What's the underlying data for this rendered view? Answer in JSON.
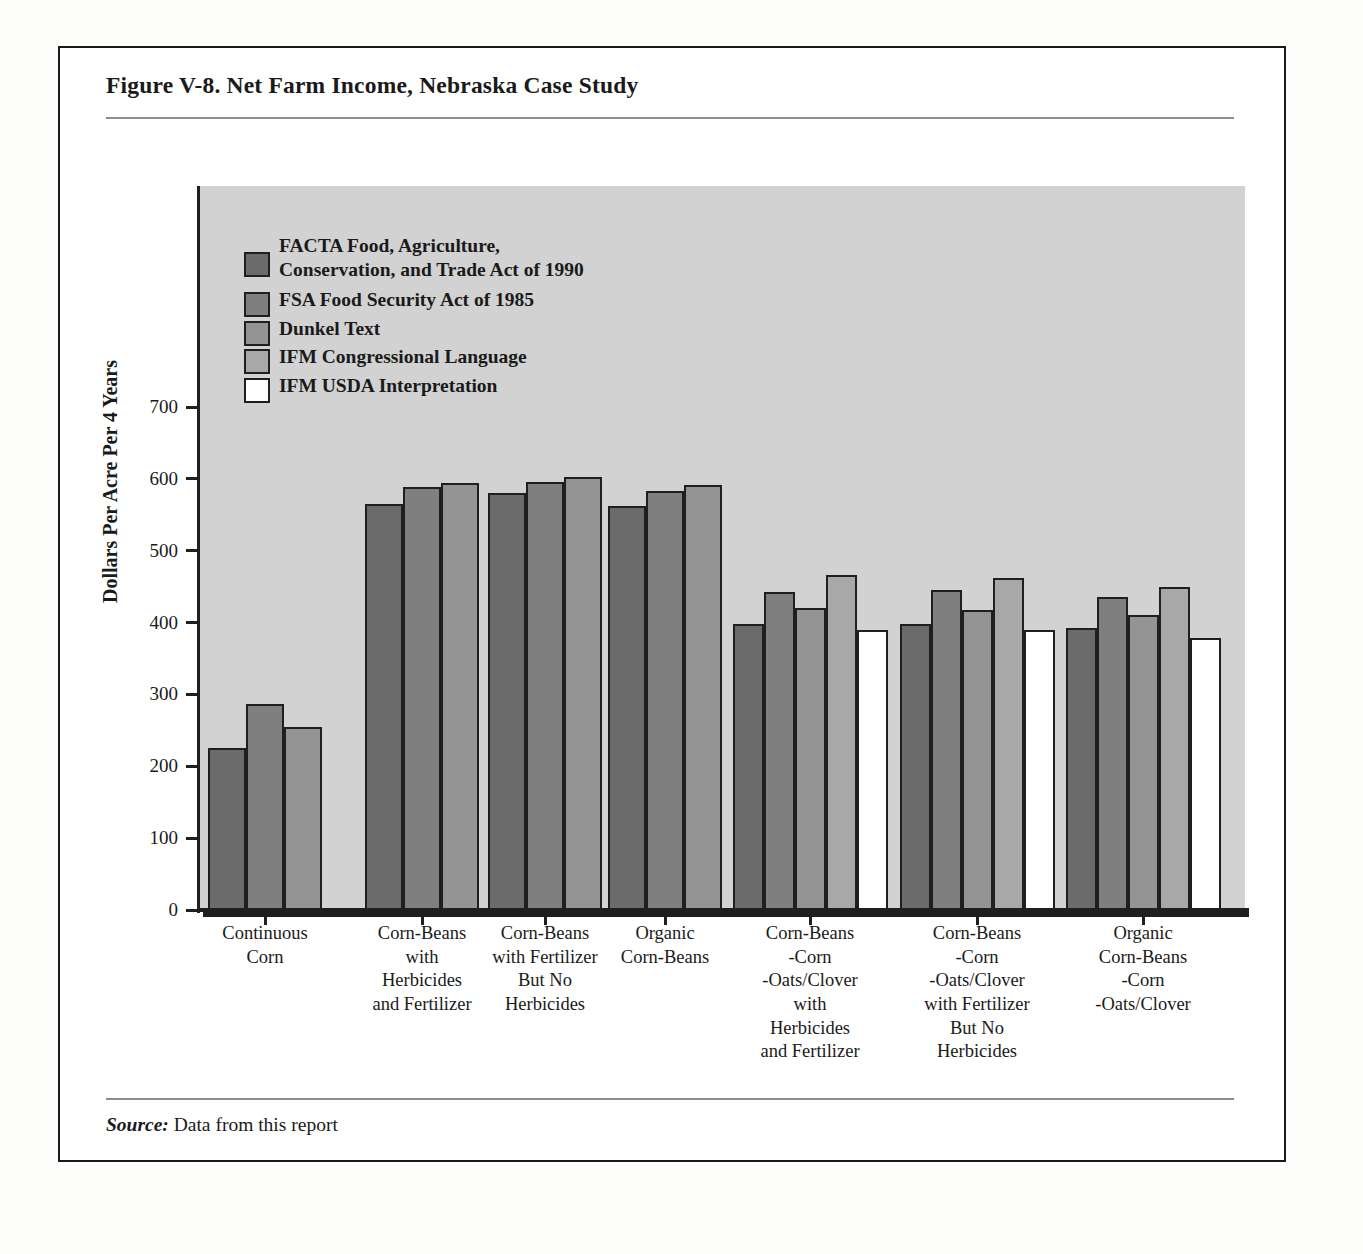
{
  "figure": {
    "title": "Figure V-8.  Net Farm Income, Nebraska Case Study",
    "source_label": "Source:",
    "source_text": " Data from this report"
  },
  "chart_data": {
    "type": "bar",
    "title": "Net Farm Income, Nebraska Case Study",
    "xlabel": "",
    "ylabel": "Dollars Per Acre Per 4 Years",
    "ylim": [
      0,
      700
    ],
    "yticks": [
      0,
      100,
      200,
      300,
      400,
      500,
      600,
      700
    ],
    "grid": false,
    "legend_position": "upper-left",
    "categories": [
      "Continuous\nCorn",
      "Corn-Beans\nwith\nHerbicides\nand Fertilizer",
      "Corn-Beans\nwith Fertilizer\nBut No\nHerbicides",
      "Organic\nCorn-Beans",
      "Corn-Beans\n-Corn\n-Oats/Clover\nwith\nHerbicides\nand Fertilizer",
      "Corn-Beans\n-Corn\n-Oats/Clover\nwith Fertilizer\nBut No\nHerbicides",
      "Organic\nCorn-Beans\n-Corn\n-Oats/Clover"
    ],
    "series": [
      {
        "name": "FACTA  Food, Agriculture, Conservation, and Trade Act of 1990",
        "short": "FACTA",
        "color": "#6b6b6b",
        "values": [
          225,
          565,
          580,
          562,
          398,
          398,
          392
        ]
      },
      {
        "name": "FSA  Food Security Act of 1985",
        "short": "FSA",
        "color": "#7f7f7f",
        "values": [
          287,
          588,
          595,
          583,
          443,
          445,
          436
        ]
      },
      {
        "name": "Dunkel Text",
        "short": "Dunkel",
        "color": "#949494",
        "values": [
          254,
          594,
          603,
          591,
          420,
          418,
          410
        ]
      },
      {
        "name": "IFM  Congressional Language",
        "short": "IFM-CL",
        "color": "#a8a8a8",
        "values": [
          null,
          null,
          null,
          null,
          466,
          462,
          450
        ]
      },
      {
        "name": "IFM  USDA Interpretation",
        "short": "IFM-USDA",
        "color": "#ffffff",
        "values": [
          null,
          null,
          null,
          null,
          390,
          390,
          379
        ]
      }
    ]
  },
  "legend": {
    "items": [
      {
        "label": "FACTA  Food, Agriculture,\nConservation, and Trade Act of 1990",
        "color": "#6b6b6b"
      },
      {
        "label": "FSA  Food Security Act of 1985",
        "color": "#7f7f7f"
      },
      {
        "label": "Dunkel Text",
        "color": "#949494"
      },
      {
        "label": "IFM  Congressional Language",
        "color": "#a8a8a8"
      },
      {
        "label": "IFM  USDA Interpretation",
        "color": "#ffffff"
      }
    ]
  },
  "axis": {
    "y_title": "Dollars Per Acre Per 4 Years",
    "y_tick_labels": [
      "700",
      "600",
      "500",
      "400",
      "300",
      "200",
      "100",
      "0"
    ]
  },
  "x_labels": [
    "Continuous\nCorn",
    "Corn-Beans\nwith\nHerbicides\nand Fertilizer",
    "Corn-Beans\nwith Fertilizer\nBut No\nHerbicides",
    "Organic\nCorn-Beans",
    "Corn-Beans\n-Corn\n-Oats/Clover\nwith\nHerbicides\nand Fertilizer",
    "Corn-Beans\n-Corn\n-Oats/Clover\nwith Fertilizer\nBut No\nHerbicides",
    "Organic\nCorn-Beans\n-Corn\n-Oats/Clover"
  ]
}
